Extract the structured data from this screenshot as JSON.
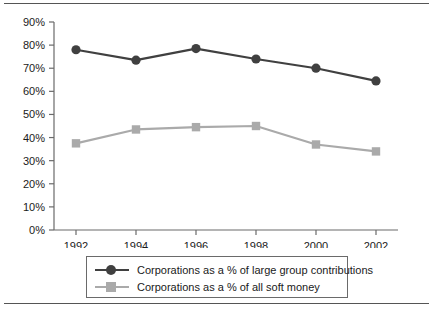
{
  "chart_data": {
    "type": "line",
    "title": "",
    "subtitle": "",
    "xlabel": "",
    "ylabel": "",
    "categories": [
      "1992",
      "1994",
      "1996",
      "1998",
      "2000",
      "2002"
    ],
    "x": [
      1992,
      1994,
      1996,
      1998,
      2000,
      2002
    ],
    "series": [
      {
        "name": "Corporations as a % of large group contributions",
        "values": [
          78,
          73.5,
          78.5,
          74,
          70,
          64.5
        ],
        "color": "#404040",
        "marker": "circle"
      },
      {
        "name": "Corporations as a % of all soft money",
        "values": [
          37.5,
          43.5,
          44.5,
          45,
          37,
          34
        ],
        "color": "#aaaaaa",
        "marker": "square"
      }
    ],
    "ylim": [
      0,
      90
    ],
    "ytick_values": [
      0,
      10,
      20,
      30,
      40,
      50,
      60,
      70,
      80,
      90
    ],
    "ytick_labels": [
      "0%",
      "10%",
      "20%",
      "30%",
      "40%",
      "50%",
      "60%",
      "70%",
      "80%",
      "90%"
    ],
    "xtick_labels": [
      "1992",
      "1994",
      "1996",
      "1998",
      "2000",
      "2002"
    ],
    "grid": false,
    "legend_position": "bottom"
  },
  "legend": {
    "items": [
      {
        "label": "Corporations as a % of large group contributions"
      },
      {
        "label": "Corporations as a % of all soft money"
      }
    ]
  },
  "colors": {
    "series_dark": "#404040",
    "series_light": "#aaaaaa",
    "axis": "#6a6a6a",
    "rule": "#555555",
    "text": "#1a1a1a"
  }
}
